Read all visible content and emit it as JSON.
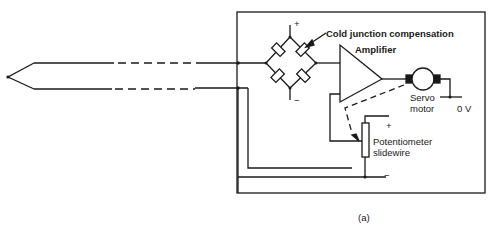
{
  "figure": {
    "caption": "(a)",
    "colors": {
      "line": "#1a1a1a",
      "background": "#ffffff"
    }
  },
  "labels": {
    "cold_junction": "Cold junction compensation",
    "amplifier": "Amplifier",
    "servo_line1": "Servo",
    "servo_line2": "motor",
    "zero_volt": "0 V",
    "pot_line1": "Potentiometer",
    "pot_line2": "slidewire",
    "bridge_plus": "+",
    "bridge_minus": "−",
    "pot_plus": "+",
    "pot_minus": "−"
  },
  "components": [
    {
      "id": "thermocouple",
      "label": "Thermocouple probe"
    },
    {
      "id": "bridge",
      "label": "Cold junction compensation bridge"
    },
    {
      "id": "amplifier",
      "label": "Amplifier"
    },
    {
      "id": "servo-motor",
      "label": "Servo motor"
    },
    {
      "id": "potentiometer",
      "label": "Potentiometer slidewire"
    }
  ]
}
